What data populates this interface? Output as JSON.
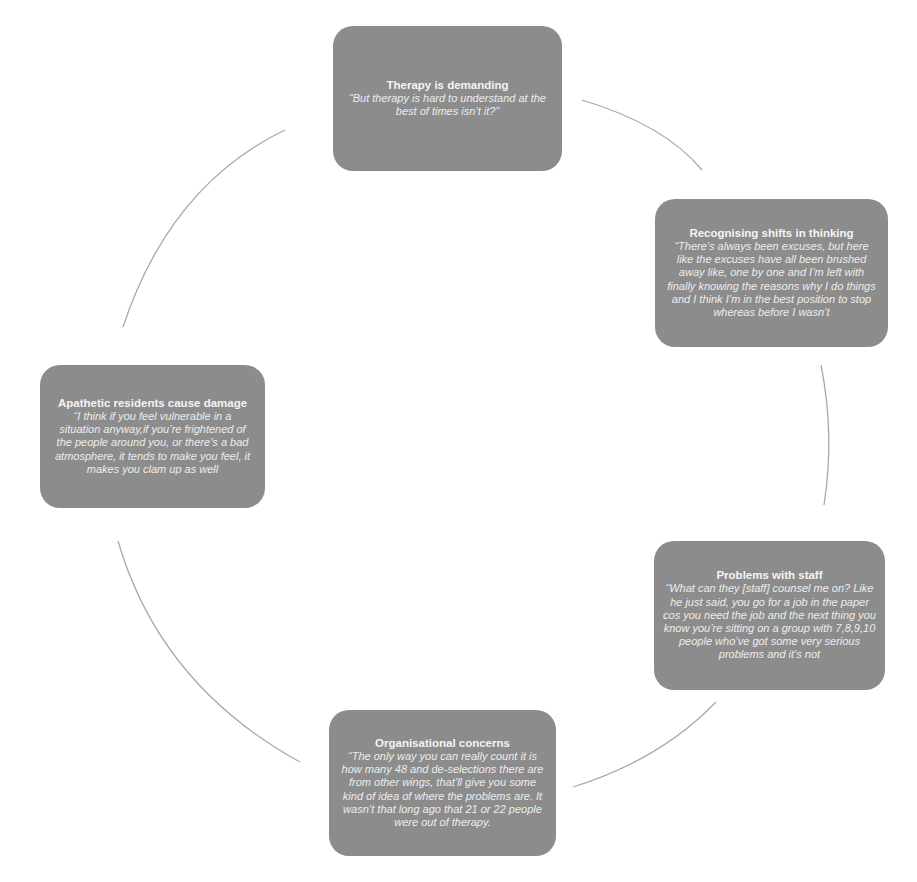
{
  "diagram": {
    "type": "cycle",
    "colors": {
      "node_fill": "#8c8c8c",
      "node_text": "#ffffff",
      "connector": "#a9a9a9",
      "background": "#ffffff"
    },
    "nodes": [
      {
        "id": "therapy-demanding",
        "title": "Therapy is demanding",
        "quote": "“But therapy is hard to understand at the best of times isn’t it?”"
      },
      {
        "id": "recognising-shifts",
        "title": "Recognising shifts in thinking",
        "quote": "“There’s always been excuses, but here like the excuses have all been brushed away like, one by one and I’m left with finally knowing the reasons why I do things and I think I’m in the best position to stop whereas before I wasn’t"
      },
      {
        "id": "problems-staff",
        "title": "Problems with staff",
        "quote": "“What can they [staff] counsel me on? Like he just said, you go for a job in the paper cos you need the job and the next thing you know you’re sitting on a group with 7,8,9,10 people who’ve got some very serious problems and it’s not"
      },
      {
        "id": "organisational-concerns",
        "title": "Organisational concerns",
        "quote": "“The only way you can really count it is how many 48 and de-selections there are from other wings, that’ll give you some kind of idea of where the problems are. It wasn’t that long ago that 21 or 22 people were out of therapy."
      },
      {
        "id": "apathetic-residents",
        "title": "Apathetic residents cause damage",
        "quote": "“I think if you feel vulnerable in a situation anyway,if you’re frightened of the people around you, or there’s a bad atmosphere, it tends to make you feel, it makes you clam up as well"
      }
    ],
    "connectors": [
      {
        "from": "therapy-demanding",
        "to": "recognising-shifts"
      },
      {
        "from": "recognising-shifts",
        "to": "problems-staff"
      },
      {
        "from": "problems-staff",
        "to": "organisational-concerns"
      },
      {
        "from": "organisational-concerns",
        "to": "apathetic-residents"
      },
      {
        "from": "apathetic-residents",
        "to": "therapy-demanding"
      }
    ]
  }
}
